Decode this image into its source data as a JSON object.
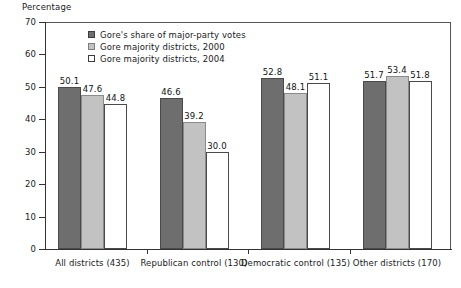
{
  "chart_data": {
    "type": "bar",
    "title": "",
    "xlabel": "",
    "ylabel": "Percentage",
    "ylim": [
      0,
      70
    ],
    "yticks": [
      0,
      10,
      20,
      30,
      40,
      50,
      60,
      70
    ],
    "ytick_labels": [
      "0",
      "10",
      "20",
      "30",
      "40",
      "50",
      "60",
      "70"
    ],
    "grid": false,
    "legend_position": "upper-left-inside",
    "categories": [
      "All districts (435)",
      "Republican control (130)",
      "Democratic control (135)",
      "Other districts (170)"
    ],
    "series": [
      {
        "name": "Gore's share of major-party votes",
        "color": "#6e6e6e",
        "values": [
          50.1,
          46.6,
          52.8,
          51.7
        ],
        "value_labels": [
          "50.1",
          "46.6",
          "52.8",
          "51.7"
        ]
      },
      {
        "name": "Gore majority districts, 2000",
        "color": "#c2c2c2",
        "values": [
          47.6,
          39.2,
          48.1,
          53.4
        ],
        "value_labels": [
          "47.6",
          "39.2",
          "48.1",
          "53.4"
        ]
      },
      {
        "name": "Gore majority districts, 2004",
        "color": "#ffffff",
        "values": [
          44.8,
          30.0,
          51.1,
          51.8
        ],
        "value_labels": [
          "44.8",
          "30.0",
          "51.1",
          "51.8"
        ]
      }
    ]
  },
  "axis": {
    "y_title": "Percentage"
  },
  "colors": {
    "series0": "#6e6e6e",
    "series1": "#c2c2c2",
    "series2": "#ffffff",
    "axis": "#333333",
    "text": "#1a1a1a"
  }
}
